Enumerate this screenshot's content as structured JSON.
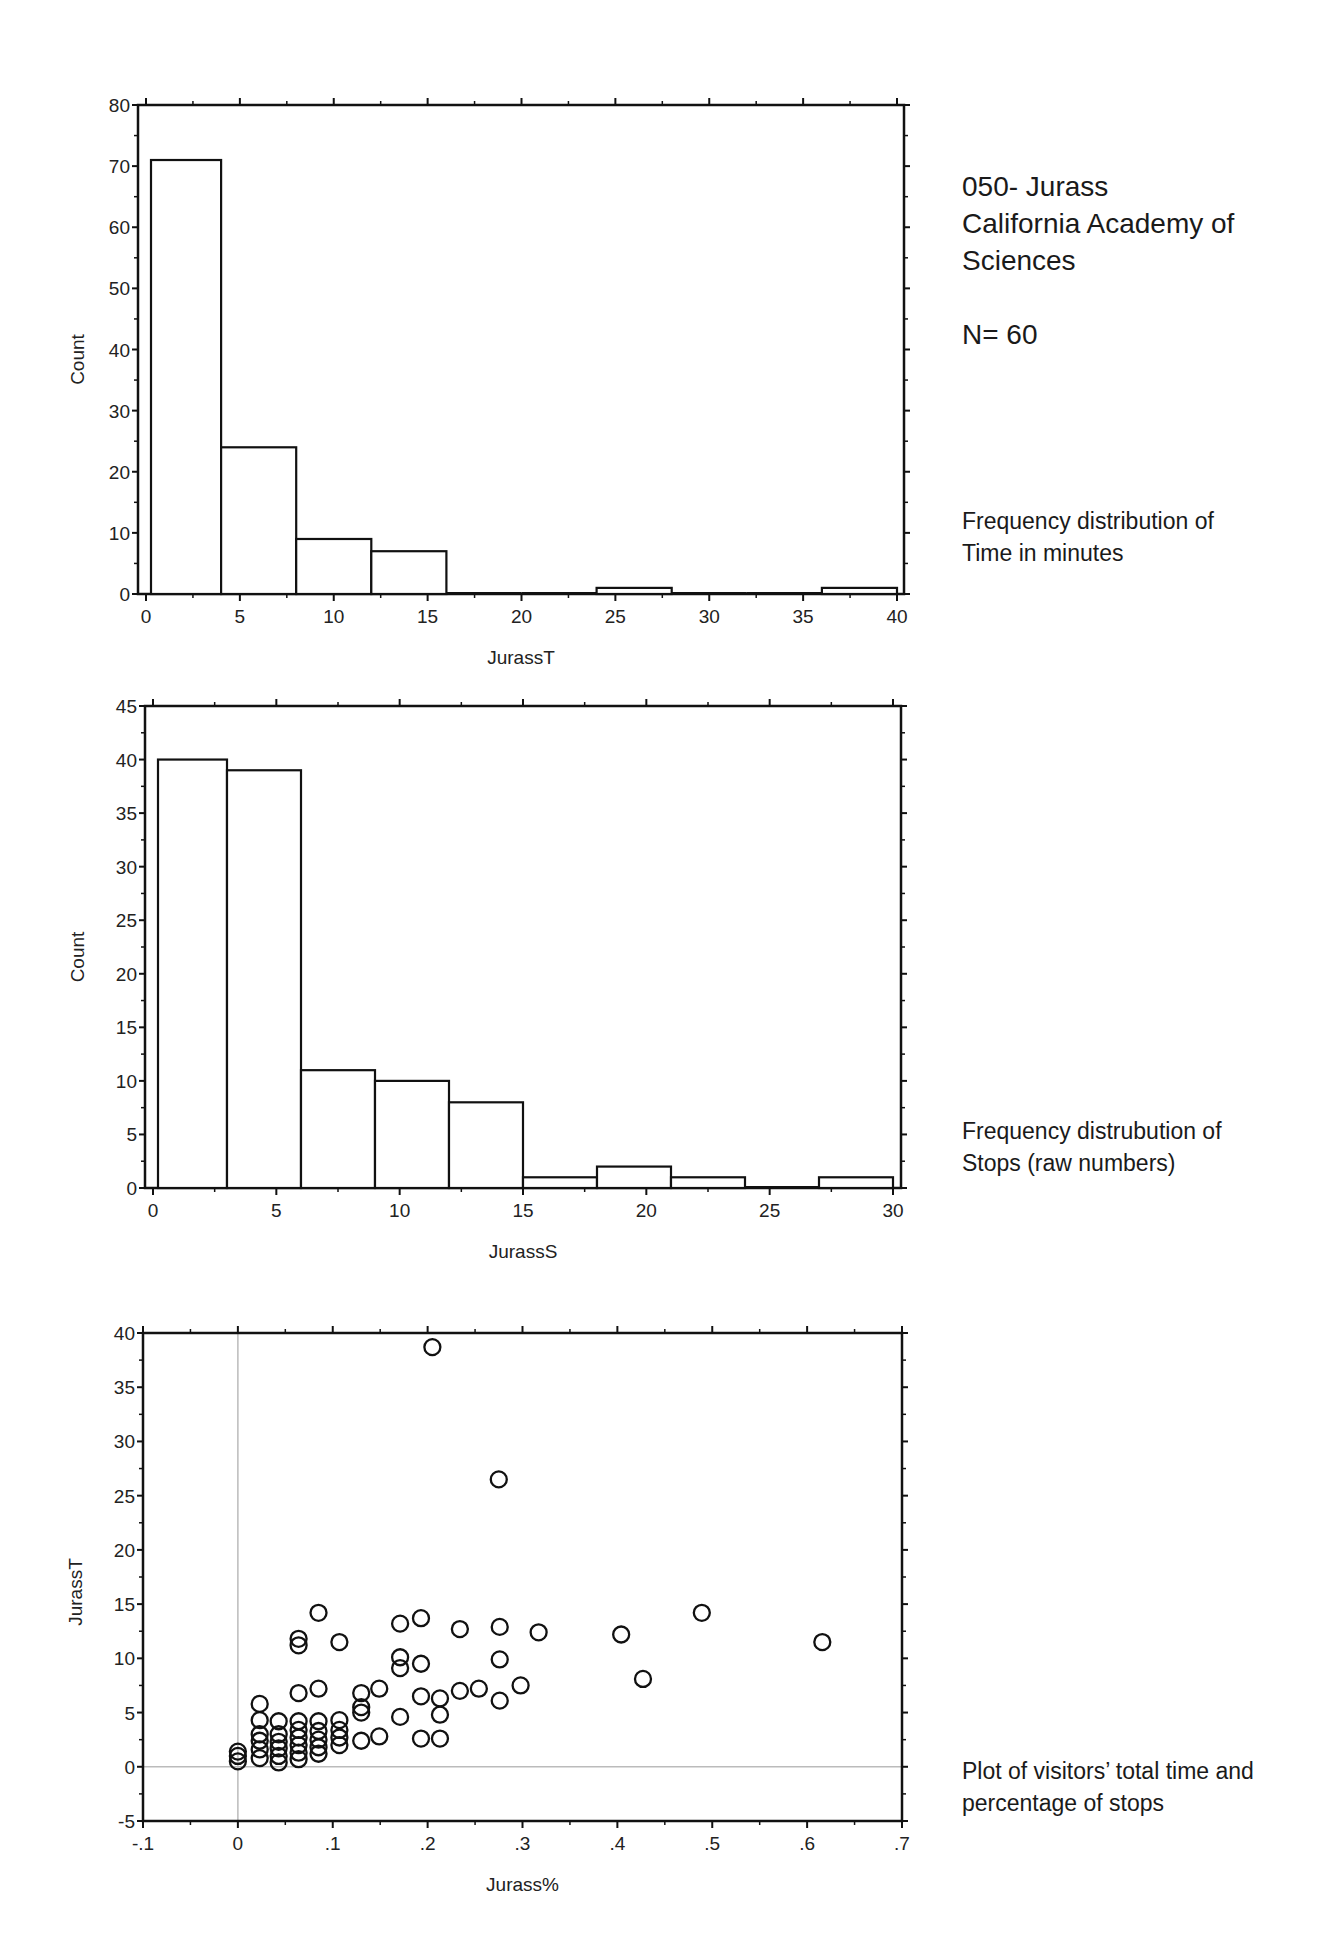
{
  "header": {
    "title_line1": "050- Jurass",
    "title_line2": "California Academy of",
    "title_line3": "Sciences",
    "n_label": "N= 60"
  },
  "captions": {
    "chart1_line1": "Frequency distribution of",
    "chart1_line2": "Time in minutes",
    "chart2_line1": "Frequency distrubution of",
    "chart2_line2": "Stops (raw numbers)",
    "chart3_line1": "Plot of visitors’ total time and",
    "chart3_line2": "percentage of stops"
  },
  "chart_data": [
    {
      "type": "bar",
      "subtype": "histogram",
      "title": "Frequency distribution of Time in minutes",
      "xlabel": "JurassT",
      "ylabel": "Count",
      "bin_edges": [
        0,
        4,
        8,
        12,
        16,
        20,
        24,
        28,
        32,
        36,
        40
      ],
      "categories": [
        "0-4",
        "4-8",
        "8-12",
        "12-16",
        "16-20",
        "20-24",
        "24-28",
        "28-32",
        "32-36",
        "36-40"
      ],
      "values": [
        71,
        24,
        9,
        7,
        0,
        0,
        1,
        0,
        0,
        1
      ],
      "xlim": [
        0,
        40
      ],
      "ylim": [
        0,
        80
      ],
      "xticks": [
        "0",
        "5",
        "10",
        "15",
        "20",
        "25",
        "30",
        "35",
        "40"
      ],
      "yticks": [
        "0",
        "10",
        "20",
        "30",
        "40",
        "50",
        "60",
        "70",
        "80"
      ],
      "grid": false
    },
    {
      "type": "bar",
      "subtype": "histogram",
      "title": "Frequency distrubution of Stops (raw numbers)",
      "xlabel": "JurassS",
      "ylabel": "Count",
      "bin_edges": [
        0,
        3,
        6,
        9,
        12,
        15,
        18,
        21,
        24,
        27,
        30
      ],
      "categories": [
        "0-3",
        "3-6",
        "6-9",
        "9-12",
        "12-15",
        "15-18",
        "18-21",
        "21-24",
        "24-27",
        "27-30"
      ],
      "values": [
        40,
        39,
        11,
        10,
        8,
        1,
        2,
        1,
        0,
        1
      ],
      "xlim": [
        0,
        30
      ],
      "ylim": [
        0,
        45
      ],
      "xticks": [
        "0",
        "5",
        "10",
        "15",
        "20",
        "25",
        "30"
      ],
      "yticks": [
        "0",
        "5",
        "10",
        "15",
        "20",
        "25",
        "30",
        "35",
        "40",
        "45"
      ],
      "grid": false
    },
    {
      "type": "scatter",
      "title": "Plot of visitors’ total time and percentage of stops",
      "xlabel": "Jurass%",
      "ylabel": "JurassT",
      "xlim": [
        -0.1,
        0.7
      ],
      "ylim": [
        -5,
        40
      ],
      "xticks": [
        "-.1",
        "0",
        ".1",
        ".2",
        ".3",
        ".4",
        ".5",
        ".6",
        ".7"
      ],
      "yticks": [
        "-5",
        "0",
        "5",
        "10",
        "15",
        "20",
        "25",
        "30",
        "35",
        "40"
      ],
      "reference_lines": {
        "x": 0,
        "y": 0
      },
      "marker": "open-circle",
      "points": [
        [
          0.205,
          38.7
        ],
        [
          0.275,
          26.5
        ],
        [
          0.085,
          14.2
        ],
        [
          0.064,
          11.8
        ],
        [
          0.064,
          11.2
        ],
        [
          0.107,
          11.5
        ],
        [
          0.171,
          13.2
        ],
        [
          0.193,
          13.7
        ],
        [
          0.234,
          12.7
        ],
        [
          0.276,
          12.9
        ],
        [
          0.317,
          12.4
        ],
        [
          0.404,
          12.2
        ],
        [
          0.489,
          14.2
        ],
        [
          0.616,
          11.5
        ],
        [
          0.427,
          8.1
        ],
        [
          0.171,
          10.1
        ],
        [
          0.171,
          9.1
        ],
        [
          0.193,
          9.5
        ],
        [
          0.276,
          9.9
        ],
        [
          0.064,
          6.8
        ],
        [
          0.085,
          7.2
        ],
        [
          0.13,
          6.8
        ],
        [
          0.149,
          7.2
        ],
        [
          0.193,
          6.5
        ],
        [
          0.213,
          6.3
        ],
        [
          0.234,
          7.0
        ],
        [
          0.254,
          7.2
        ],
        [
          0.276,
          6.1
        ],
        [
          0.298,
          7.5
        ],
        [
          0.023,
          5.8
        ],
        [
          0.13,
          5.0
        ],
        [
          0.13,
          5.5
        ],
        [
          0.171,
          4.6
        ],
        [
          0.213,
          4.8
        ],
        [
          0.13,
          2.4
        ],
        [
          0.149,
          2.8
        ],
        [
          0.193,
          2.6
        ],
        [
          0.213,
          2.6
        ],
        [
          0.0,
          0.5
        ],
        [
          0.0,
          1.0
        ],
        [
          0.0,
          1.4
        ],
        [
          0.023,
          0.8
        ],
        [
          0.023,
          1.6
        ],
        [
          0.023,
          2.4
        ],
        [
          0.023,
          3.0
        ],
        [
          0.023,
          4.3
        ],
        [
          0.043,
          0.4
        ],
        [
          0.043,
          1.0
        ],
        [
          0.043,
          1.7
        ],
        [
          0.043,
          2.3
        ],
        [
          0.043,
          3.0
        ],
        [
          0.043,
          4.2
        ],
        [
          0.064,
          0.7
        ],
        [
          0.064,
          1.3
        ],
        [
          0.064,
          2.0
        ],
        [
          0.064,
          2.7
        ],
        [
          0.064,
          3.4
        ],
        [
          0.064,
          4.2
        ],
        [
          0.085,
          1.2
        ],
        [
          0.085,
          1.8
        ],
        [
          0.085,
          2.5
        ],
        [
          0.085,
          3.3
        ],
        [
          0.085,
          4.2
        ],
        [
          0.107,
          2.0
        ],
        [
          0.107,
          2.7
        ],
        [
          0.107,
          3.4
        ],
        [
          0.107,
          4.3
        ]
      ],
      "grid": false
    }
  ]
}
